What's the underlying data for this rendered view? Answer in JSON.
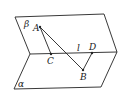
{
  "diagram": {
    "type": "dihedral-angle",
    "planes": [
      {
        "name": "beta",
        "label": "β"
      },
      {
        "name": "alpha",
        "label": "α"
      }
    ],
    "edge": {
      "label": "l"
    },
    "points": {
      "A": "A",
      "B": "B",
      "C": "C",
      "D": "D"
    },
    "segments": [
      "AC",
      "AB",
      "BD"
    ]
  }
}
